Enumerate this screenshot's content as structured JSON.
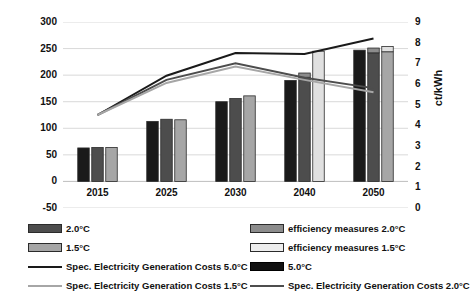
{
  "chart_data": {
    "type": "bar",
    "title": "",
    "subtitle": "",
    "categories": [
      "2015",
      "2025",
      "2030",
      "2040",
      "2050"
    ],
    "xlabel": "",
    "ylabel": "billion $",
    "ylabel_secondary": "ct/kWh",
    "ylim": [
      -50,
      300
    ],
    "yticks": [
      "300",
      "250",
      "200",
      "150",
      "100",
      "50",
      "0",
      "-50"
    ],
    "ytick_values": [
      300,
      250,
      200,
      150,
      100,
      50,
      0,
      -50
    ],
    "ylim_secondary": [
      0,
      9
    ],
    "yticks_secondary": [
      "9",
      "8",
      "7",
      "6",
      "5",
      "4",
      "3",
      "2",
      "1",
      "0"
    ],
    "ytick_values_secondary": [
      9,
      8,
      7,
      6,
      5,
      4,
      3,
      2,
      1,
      0
    ],
    "grid": true,
    "legend_position": "bottom",
    "bar_series": [
      {
        "name": "5.0°C",
        "color": "#1a1a1a",
        "axis": "left",
        "values": [
          63,
          113,
          150,
          190,
          247
        ]
      },
      {
        "name": "2.0°C",
        "color": "#4d4d4d",
        "axis": "left",
        "values": [
          64,
          117,
          156,
          196,
          242
        ]
      },
      {
        "name": "efficiency measures 2.0°C",
        "color": "#8c8c8c",
        "axis": "left",
        "stacked_on": "2.0°C",
        "values": [
          0,
          0,
          0,
          8,
          9
        ]
      },
      {
        "name": "1.5°C",
        "color": "#a6a6a6",
        "axis": "left",
        "values": [
          64,
          116,
          161,
          0,
          244
        ]
      },
      {
        "name": "efficiency measures 1.5°C",
        "color": "#e0e0e0",
        "axis": "left",
        "stacked_on": "1.5°C",
        "values": [
          0,
          0,
          0,
          245,
          10
        ]
      }
    ],
    "line_series": [
      {
        "name": "Spec. Electricity Generation Costs 5.0°C",
        "color": "#1a1a1a",
        "axis": "right",
        "values": [
          4.5,
          6.4,
          7.5,
          7.45,
          8.2
        ]
      },
      {
        "name": "Spec. Electricity Generation Costs 2.0°C",
        "color": "#4d4d4d",
        "axis": "right",
        "values": [
          4.5,
          6.2,
          7.0,
          6.3,
          5.8
        ]
      },
      {
        "name": "Spec. Electricity Generation Costs 1.5°C",
        "color": "#a6a6a6",
        "axis": "right",
        "values": [
          4.5,
          6.05,
          6.85,
          6.2,
          5.6
        ]
      }
    ]
  },
  "axes": {
    "left_title": "billion $",
    "right_title": "ct/kWh"
  },
  "legend": {
    "items": [
      {
        "label": "2.0°C",
        "type": "swatch",
        "color": "#4d4d4d",
        "border": "#2b2b2b"
      },
      {
        "label": "efficiency measures 2.0°C",
        "type": "swatch",
        "color": "#8c8c8c",
        "border": "#2b2b2b"
      },
      {
        "label": "1.5°C",
        "type": "swatch",
        "color": "#a6a6a6",
        "border": "#2b2b2b"
      },
      {
        "label": "efficiency measures 1.5°C",
        "type": "swatch",
        "color": "#ededed",
        "border": "#2b2b2b"
      },
      {
        "label": "Spec. Electricity Generation Costs 5.0°C",
        "type": "line",
        "color": "#1a1a1a"
      },
      {
        "label": "5.0°C",
        "type": "swatch",
        "color": "#111111",
        "border": "#000000"
      },
      {
        "label": "Spec. Electricity Generation Costs 1.5°C",
        "type": "line",
        "color": "#a6a6a6"
      },
      {
        "label": "Spec. Electricity Generation Costs 2.0°C",
        "type": "line",
        "color": "#4d4d4d"
      }
    ]
  },
  "colors": {
    "bar_50": "#1a1a1a",
    "bar_20": "#4d4d4d",
    "bar_eff_20": "#8c8c8c",
    "bar_15": "#a6a6a6",
    "bar_eff_15": "#ededed",
    "gridline": "#d9d9d9",
    "axis": "#9a9a9a",
    "text": "#111111"
  }
}
